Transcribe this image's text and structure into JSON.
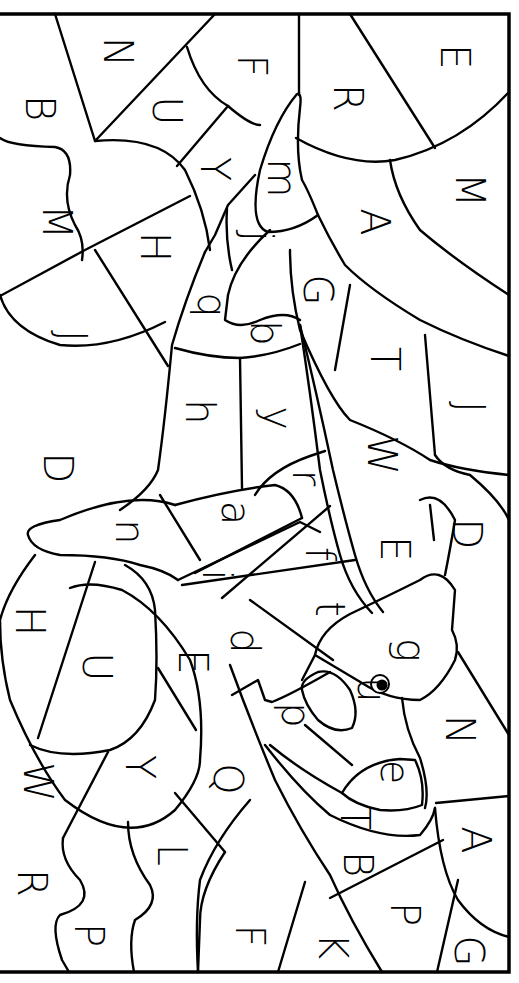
{
  "page": {
    "type": "color-by-letter worksheet",
    "orientation": "rotated 90 degrees clockwise",
    "background": "#ffffff",
    "line_color": "#000000"
  },
  "labels": [
    {
      "id": "N1",
      "text": "N",
      "x": 118,
      "y": 52
    },
    {
      "id": "B1",
      "text": "B",
      "x": 40,
      "y": 108
    },
    {
      "id": "U1",
      "text": "U",
      "x": 167,
      "y": 111
    },
    {
      "id": "F1",
      "text": "F",
      "x": 252,
      "y": 66
    },
    {
      "id": "R1",
      "text": "R",
      "x": 348,
      "y": 98
    },
    {
      "id": "E1",
      "text": "E",
      "x": 455,
      "y": 57
    },
    {
      "id": "Y1",
      "text": "Y",
      "x": 215,
      "y": 169
    },
    {
      "id": "M1",
      "text": "M",
      "x": 57,
      "y": 222
    },
    {
      "id": "H1",
      "text": "H",
      "x": 155,
      "y": 247
    },
    {
      "id": "m1",
      "text": "m",
      "x": 282,
      "y": 178
    },
    {
      "id": "j1",
      "text": "j",
      "x": 258,
      "y": 236
    },
    {
      "id": "A1",
      "text": "A",
      "x": 375,
      "y": 222
    },
    {
      "id": "M2",
      "text": "M",
      "x": 470,
      "y": 190
    },
    {
      "id": "q1",
      "text": "q",
      "x": 212,
      "y": 305
    },
    {
      "id": "G1",
      "text": "G",
      "x": 318,
      "y": 290
    },
    {
      "id": "J1",
      "text": "J",
      "x": 72,
      "y": 336
    },
    {
      "id": "b1",
      "text": "b",
      "x": 265,
      "y": 333
    },
    {
      "id": "h1",
      "text": "h",
      "x": 200,
      "y": 412
    },
    {
      "id": "y1",
      "text": "y",
      "x": 278,
      "y": 418
    },
    {
      "id": "T1",
      "text": "T",
      "x": 385,
      "y": 359
    },
    {
      "id": "J2",
      "text": "J",
      "x": 470,
      "y": 407
    },
    {
      "id": "W1",
      "text": "W",
      "x": 382,
      "y": 455
    },
    {
      "id": "D1",
      "text": "D",
      "x": 58,
      "y": 468
    },
    {
      "id": "r1",
      "text": "r",
      "x": 307,
      "y": 478
    },
    {
      "id": "n1",
      "text": "n",
      "x": 130,
      "y": 532
    },
    {
      "id": "a1",
      "text": "a",
      "x": 236,
      "y": 513
    },
    {
      "id": "D2",
      "text": "D",
      "x": 467,
      "y": 534
    },
    {
      "id": "f1",
      "text": "f",
      "x": 320,
      "y": 554
    },
    {
      "id": "E2",
      "text": "E",
      "x": 395,
      "y": 549
    },
    {
      "id": "i1",
      "text": "i",
      "x": 217,
      "y": 575
    },
    {
      "id": "H2",
      "text": "H",
      "x": 30,
      "y": 621
    },
    {
      "id": "t1",
      "text": "t",
      "x": 330,
      "y": 609
    },
    {
      "id": "d1",
      "text": "d",
      "x": 245,
      "y": 641
    },
    {
      "id": "U2",
      "text": "U",
      "x": 97,
      "y": 667
    },
    {
      "id": "E3",
      "text": "E",
      "x": 193,
      "y": 662
    },
    {
      "id": "g1",
      "text": "g",
      "x": 411,
      "y": 650
    },
    {
      "id": "u1",
      "text": "u",
      "x": 372,
      "y": 690
    },
    {
      "id": "p1",
      "text": "p",
      "x": 296,
      "y": 715
    },
    {
      "id": "W2",
      "text": "W",
      "x": 38,
      "y": 782
    },
    {
      "id": "Y2",
      "text": "Y",
      "x": 140,
      "y": 767
    },
    {
      "id": "Q1",
      "text": "Q",
      "x": 228,
      "y": 779
    },
    {
      "id": "e1",
      "text": "e",
      "x": 395,
      "y": 772
    },
    {
      "id": "N2",
      "text": "N",
      "x": 460,
      "y": 730
    },
    {
      "id": "T2",
      "text": "T",
      "x": 355,
      "y": 818
    },
    {
      "id": "L1",
      "text": "L",
      "x": 172,
      "y": 855
    },
    {
      "id": "B2",
      "text": "B",
      "x": 358,
      "y": 864
    },
    {
      "id": "A2",
      "text": "A",
      "x": 476,
      "y": 840
    },
    {
      "id": "R2",
      "text": "R",
      "x": 32,
      "y": 883
    },
    {
      "id": "F2",
      "text": "F",
      "x": 250,
      "y": 936
    },
    {
      "id": "P1",
      "text": "P",
      "x": 89,
      "y": 935
    },
    {
      "id": "P2",
      "text": "P",
      "x": 405,
      "y": 914
    },
    {
      "id": "K1",
      "text": "K",
      "x": 333,
      "y": 946
    },
    {
      "id": "G2",
      "text": "G",
      "x": 469,
      "y": 951
    }
  ],
  "eye": {
    "x": 380,
    "y": 684,
    "r_outer": 9,
    "r_inner": 5.5
  }
}
